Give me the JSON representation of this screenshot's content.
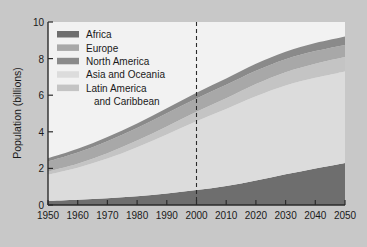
{
  "figure": {
    "background_color": "#c8c8c8",
    "plot_background_color": "#f2f2f2",
    "axis_color": "#2b2b2b"
  },
  "chart_data": {
    "type": "area",
    "stacked": true,
    "title": "",
    "xlabel": "",
    "ylabel": "Population (billions)",
    "xlim": [
      1950,
      2050
    ],
    "ylim": [
      0,
      10
    ],
    "grid": false,
    "legend_position": "upper-left-inside",
    "x": [
      1950,
      1960,
      1970,
      1980,
      1990,
      2000,
      2010,
      2020,
      2030,
      2040,
      2050
    ],
    "xticklabels": [
      "1950",
      "1960",
      "1970",
      "1980",
      "1990",
      "2000",
      "2010",
      "2020",
      "2030",
      "2040",
      "2050"
    ],
    "yticklabels": [
      "0",
      "2",
      "4",
      "6",
      "8",
      "10"
    ],
    "yticks": [
      0,
      2,
      4,
      6,
      8,
      10
    ],
    "annotations": [
      {
        "type": "vertical-dashed-line",
        "x": 2000,
        "label": ""
      }
    ],
    "series": [
      {
        "name": "Africa",
        "color": "#6e6e6e",
        "values": [
          0.23,
          0.29,
          0.37,
          0.48,
          0.63,
          0.82,
          1.04,
          1.34,
          1.68,
          2.0,
          2.3
        ]
      },
      {
        "name": "Asia and Oceania",
        "color": "#dcdcdc",
        "values": [
          1.43,
          1.75,
          2.17,
          2.68,
          3.22,
          3.75,
          4.2,
          4.6,
          4.85,
          4.95,
          5.0
        ]
      },
      {
        "name": "Latin America and Caribbean",
        "color": "#c4c4c4",
        "values": [
          0.17,
          0.22,
          0.29,
          0.36,
          0.44,
          0.52,
          0.59,
          0.67,
          0.73,
          0.77,
          0.79
        ]
      },
      {
        "name": "Europe",
        "color": "#a8a8a8",
        "values": [
          0.55,
          0.61,
          0.66,
          0.69,
          0.72,
          0.73,
          0.74,
          0.73,
          0.71,
          0.69,
          0.66
        ]
      },
      {
        "name": "North America",
        "color": "#8a8a8a",
        "values": [
          0.17,
          0.2,
          0.23,
          0.25,
          0.28,
          0.31,
          0.34,
          0.38,
          0.41,
          0.44,
          0.46
        ]
      }
    ]
  },
  "legend": {
    "items": [
      {
        "label": "Africa",
        "color": "#6e6e6e"
      },
      {
        "label": "Europe",
        "color": "#a8a8a8"
      },
      {
        "label": "North America",
        "color": "#8a8a8a"
      },
      {
        "label": "Asia and Oceania",
        "color": "#dcdcdc"
      },
      {
        "label": "Latin America",
        "color": "#c4c4c4"
      },
      {
        "label": "and Caribbean",
        "color": ""
      }
    ]
  },
  "axes": {
    "ylabel": "Population (billions)",
    "ytick_0": "0",
    "ytick_2": "2",
    "ytick_4": "4",
    "ytick_6": "6",
    "ytick_8": "8",
    "ytick_10": "10",
    "xtick_1950": "1950",
    "xtick_1960": "1960",
    "xtick_1970": "1970",
    "xtick_1980": "1980",
    "xtick_1990": "1990",
    "xtick_2000": "2000",
    "xtick_2010": "2010",
    "xtick_2020": "2020",
    "xtick_2030": "2030",
    "xtick_2040": "2040",
    "xtick_2050": "2050"
  }
}
